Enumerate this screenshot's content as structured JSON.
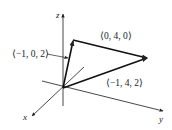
{
  "diagram": {
    "type": "3d-vector-diagram",
    "axes": {
      "x": {
        "label": "x"
      },
      "y": {
        "label": "y"
      },
      "z": {
        "label": "z"
      }
    },
    "vectors": [
      {
        "name": "u",
        "label": "⟨−1, 0, 2⟩",
        "components": [
          -1,
          0,
          2
        ]
      },
      {
        "name": "v",
        "label": "⟨0, 4, 0⟩",
        "components": [
          0,
          4,
          0
        ]
      },
      {
        "name": "sum",
        "label": "⟨−1, 4, 2⟩",
        "components": [
          -1,
          4,
          2
        ]
      }
    ],
    "colors": {
      "line": "#222222",
      "background": "#ffffff"
    }
  }
}
